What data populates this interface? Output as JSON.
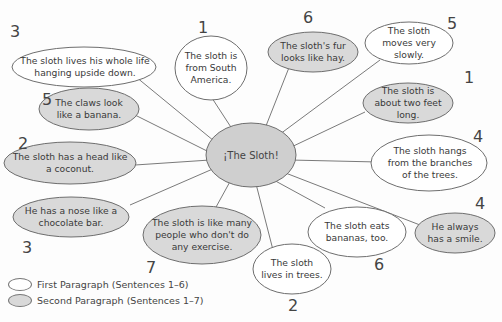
{
  "diagram": {
    "type": "web / idea map",
    "center": {
      "label": "¡The Sloth!"
    },
    "colors": {
      "first_paragraph_fill": "#ffffff",
      "second_paragraph_fill": "#d9d9d9",
      "stroke": "#6e6e6e",
      "text": "#3a3a3a"
    },
    "bubbles": [
      {
        "id": "b1",
        "text": "The sloth lives his whole life hanging upside down.",
        "number": "3",
        "paragraph": "first"
      },
      {
        "id": "b2",
        "text": "The sloth is from South America.",
        "number": "1",
        "paragraph": "first"
      },
      {
        "id": "b3",
        "text": "The sloth's fur looks like hay.",
        "number": "6",
        "paragraph": "second"
      },
      {
        "id": "b4",
        "text": "The sloth moves very slowly.",
        "number": "5",
        "paragraph": "first"
      },
      {
        "id": "b5",
        "text": "The sloth is about two feet long.",
        "number": "1",
        "paragraph": "second"
      },
      {
        "id": "b6",
        "text": "The claws look like a banana.",
        "number": "5",
        "paragraph": "second"
      },
      {
        "id": "b7",
        "text": "The sloth has a head like a coconut.",
        "number": "2",
        "paragraph": "second"
      },
      {
        "id": "b8",
        "text": "The sloth hangs from the branches of the trees.",
        "number": "4",
        "paragraph": "first"
      },
      {
        "id": "b9",
        "text": "He has a nose like a chocolate bar.",
        "number": "3",
        "paragraph": "second"
      },
      {
        "id": "b10",
        "text": "The sloth is like many people who don't do any exercise.",
        "number": "7",
        "paragraph": "second"
      },
      {
        "id": "b11",
        "text": "The sloth eats bananas, too.",
        "number": "6",
        "paragraph": "first"
      },
      {
        "id": "b12",
        "text": "He always has a smile.",
        "number": "4",
        "paragraph": "second"
      },
      {
        "id": "b13",
        "text": "The sloth lives in trees.",
        "number": "2",
        "paragraph": "first"
      }
    ]
  },
  "legend": {
    "first": "First Paragraph (Sentences 1–6)",
    "second": "Second Paragraph (Sentences 1–7)"
  }
}
